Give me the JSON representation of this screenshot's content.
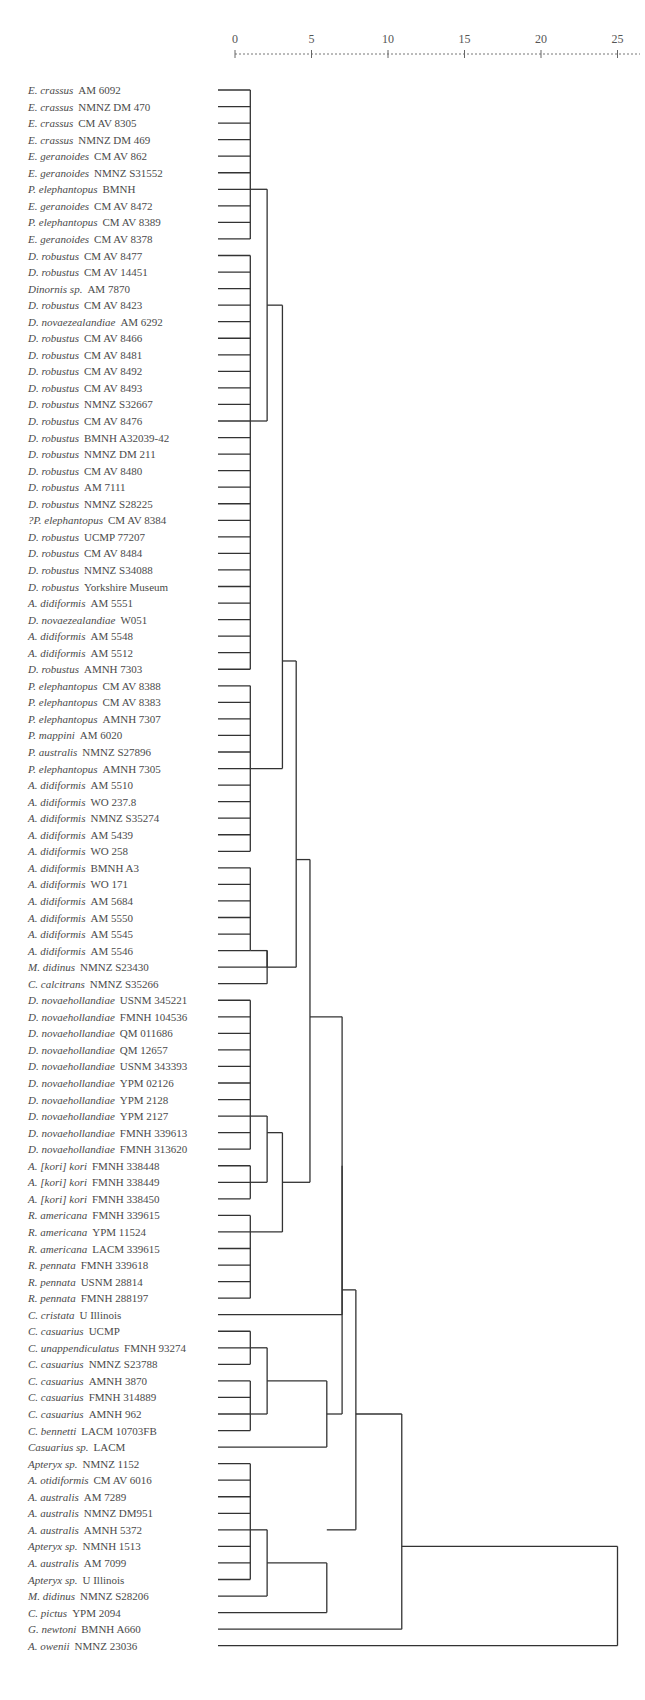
{
  "chart_data": {
    "type": "dendrogram",
    "title": "",
    "xlabel": "",
    "axis": {
      "ticks": [
        0,
        5,
        10,
        15,
        20,
        25
      ],
      "tick_labels": [
        "0",
        "5",
        "10",
        "15",
        "20",
        "25"
      ],
      "range": [
        0,
        25
      ],
      "style": "dashed ruler at top"
    },
    "leaves": [
      {
        "species": "E. crassus",
        "specimen": "AM 6092"
      },
      {
        "species": "E. crassus",
        "specimen": "NMNZ DM 470"
      },
      {
        "species": "E. crassus",
        "specimen": "CM AV 8305"
      },
      {
        "species": "E. crassus",
        "specimen": "NMNZ DM 469"
      },
      {
        "species": "E. geranoides",
        "specimen": "CM AV 862"
      },
      {
        "species": "E. geranoides",
        "specimen": "NMNZ S31552"
      },
      {
        "species": "P. elephantopus",
        "specimen": "BMNH"
      },
      {
        "species": "E. geranoides",
        "specimen": "CM AV 8472"
      },
      {
        "species": "P. elephantopus",
        "specimen": "CM AV 8389"
      },
      {
        "species": "E. geranoides",
        "specimen": "CM AV 8378"
      },
      {
        "species": "D. robustus",
        "specimen": "CM AV 8477"
      },
      {
        "species": "D. robustus",
        "specimen": "CM AV 14451"
      },
      {
        "species": "Dinornis sp.",
        "specimen": "AM 7870"
      },
      {
        "species": "D. robustus",
        "specimen": "CM AV 8423"
      },
      {
        "species": "D. novaezealandiae",
        "specimen": "AM 6292"
      },
      {
        "species": "D. robustus",
        "specimen": "CM AV 8466"
      },
      {
        "species": "D. robustus",
        "specimen": "CM AV 8481"
      },
      {
        "species": "D. robustus",
        "specimen": "CM AV 8492"
      },
      {
        "species": "D. robustus",
        "specimen": "CM AV 8493"
      },
      {
        "species": "D. robustus",
        "specimen": "NMNZ S32667"
      },
      {
        "species": "D. robustus",
        "specimen": "CM AV 8476"
      },
      {
        "species": "D. robustus",
        "specimen": "BMNH A32039-42"
      },
      {
        "species": "D. robustus",
        "specimen": "NMNZ DM 211"
      },
      {
        "species": "D. robustus",
        "specimen": "CM AV 8480"
      },
      {
        "species": "D. robustus",
        "specimen": "AM 7111"
      },
      {
        "species": "D. robustus",
        "specimen": "NMNZ S28225"
      },
      {
        "species": "?P. elephantopus",
        "specimen": "CM AV 8384"
      },
      {
        "species": "D. robustus",
        "specimen": "UCMP 77207"
      },
      {
        "species": "D. robustus",
        "specimen": "CM AV 8484"
      },
      {
        "species": "D. robustus",
        "specimen": "NMNZ S34088"
      },
      {
        "species": "D. robustus",
        "specimen": "Yorkshire Museum"
      },
      {
        "species": "A. didiformis",
        "specimen": "AM 5551"
      },
      {
        "species": "D. novaezealandiae",
        "specimen": "W051"
      },
      {
        "species": "A. didiformis",
        "specimen": "AM 5548"
      },
      {
        "species": "A. didiformis",
        "specimen": "AM 5512"
      },
      {
        "species": "D. robustus",
        "specimen": "AMNH 7303"
      },
      {
        "species": "P. elephantopus",
        "specimen": "CM AV 8388"
      },
      {
        "species": "P. elephantopus",
        "specimen": "CM AV 8383"
      },
      {
        "species": "P. elephantopus",
        "specimen": "AMNH 7307"
      },
      {
        "species": "P. mappini",
        "specimen": "AM 6020"
      },
      {
        "species": "P. australis",
        "specimen": "NMNZ S27896"
      },
      {
        "species": "P. elephantopus",
        "specimen": "AMNH 7305"
      },
      {
        "species": "A. didiformis",
        "specimen": "AM 5510"
      },
      {
        "species": "A. didiformis",
        "specimen": "WO 237.8"
      },
      {
        "species": "A. didiformis",
        "specimen": "NMNZ S35274"
      },
      {
        "species": "A. didiformis",
        "specimen": "AM 5439"
      },
      {
        "species": "A. didiformis",
        "specimen": "WO 258"
      },
      {
        "species": "A. didiformis",
        "specimen": "BMNH A3"
      },
      {
        "species": "A. didiformis",
        "specimen": "WO 171"
      },
      {
        "species": "A. didiformis",
        "specimen": "AM 5684"
      },
      {
        "species": "A. didiformis",
        "specimen": "AM 5550"
      },
      {
        "species": "A. didiformis",
        "specimen": "AM 5545"
      },
      {
        "species": "A. didiformis",
        "specimen": "AM 5546"
      },
      {
        "species": "M. didinus",
        "specimen": "NMNZ S23430"
      },
      {
        "species": "C. calcitrans",
        "specimen": "NMNZ S35266"
      },
      {
        "species": "D. novaehollandiae",
        "specimen": "USNM 345221"
      },
      {
        "species": "D. novaehollandiae",
        "specimen": "FMNH 104536"
      },
      {
        "species": "D. novaehollandiae",
        "specimen": "QM 011686"
      },
      {
        "species": "D. novaehollandiae",
        "specimen": "QM 12657"
      },
      {
        "species": "D. novaehollandiae",
        "specimen": "USNM 343393"
      },
      {
        "species": "D. novaehollandiae",
        "specimen": "YPM 02126"
      },
      {
        "species": "D. novaehollandiae",
        "specimen": "YPM 2128"
      },
      {
        "species": "D. novaehollandiae",
        "specimen": "YPM 2127"
      },
      {
        "species": "D. novaehollandiae",
        "specimen": "FMNH 339613"
      },
      {
        "species": "D. novaehollandiae",
        "specimen": "FMNH 313620"
      },
      {
        "species": "A. [kori] kori",
        "specimen": "FMNH 338448"
      },
      {
        "species": "A. [kori] kori",
        "specimen": "FMNH 338449"
      },
      {
        "species": "A. [kori] kori",
        "specimen": "FMNH 338450"
      },
      {
        "species": "R. americana",
        "specimen": "FMNH 339615"
      },
      {
        "species": "R. americana",
        "specimen": "YPM 11524"
      },
      {
        "species": "R. americana",
        "specimen": "LACM 339615"
      },
      {
        "species": "R. pennata",
        "specimen": "FMNH 339618"
      },
      {
        "species": "R. pennata",
        "specimen": "USNM 28814"
      },
      {
        "species": "R. pennata",
        "specimen": "FMNH 288197"
      },
      {
        "species": "C. cristata",
        "specimen": "U Illinois"
      },
      {
        "species": "C. casuarius",
        "specimen": "UCMP"
      },
      {
        "species": "C. unappendiculatus",
        "specimen": "FMNH 93274"
      },
      {
        "species": "C. casuarius",
        "specimen": "NMNZ S23788"
      },
      {
        "species": "C. casuarius",
        "specimen": "AMNH 3870"
      },
      {
        "species": "C. casuarius",
        "specimen": "FMNH 314889"
      },
      {
        "species": "C. casuarius",
        "specimen": "AMNH 962"
      },
      {
        "species": "C. bennetti",
        "specimen": "LACM 10703FB"
      },
      {
        "species": "Casuarius sp.",
        "specimen": "LACM"
      },
      {
        "species": "Apteryx sp.",
        "specimen": "NMNZ 1152"
      },
      {
        "species": "A. otidiformis",
        "specimen": "CM AV 6016"
      },
      {
        "species": "A. australis",
        "specimen": "AM 7289"
      },
      {
        "species": "A. australis",
        "specimen": "NMNZ DM951"
      },
      {
        "species": "A. australis",
        "specimen": "AMNH 5372"
      },
      {
        "species": "Apteryx sp.",
        "specimen": "NMNH 1513"
      },
      {
        "species": "A. australis",
        "specimen": "AM 7099"
      },
      {
        "species": "Apteryx sp.",
        "specimen": "U Illinois"
      },
      {
        "species": "M. didinus",
        "specimen": "NMNZ S28206"
      },
      {
        "species": "C. pictus",
        "specimen": "YPM 2094"
      },
      {
        "species": "G. newtoni",
        "specimen": "BMNH A660"
      },
      {
        "species": "A. owenii",
        "specimen": "NMNZ 23036"
      }
    ],
    "clusters": [
      {
        "id": "c1",
        "leaves": [
          0,
          9
        ],
        "height": 1.0
      },
      {
        "id": "c2",
        "leaves": [
          10,
          35
        ],
        "height": 1.0
      },
      {
        "id": "c3",
        "leaves": [
          36,
          46
        ],
        "height": 1.0
      },
      {
        "id": "c4",
        "leaves": [
          47,
          52
        ],
        "height": 1.0
      },
      {
        "id": "c5",
        "leaves": [
          55,
          64
        ],
        "height": 1.0
      },
      {
        "id": "c6",
        "leaves": [
          65,
          67
        ],
        "height": 1.0
      },
      {
        "id": "c7",
        "leaves": [
          68,
          73
        ],
        "height": 1.0
      },
      {
        "id": "c8",
        "leaves": [
          75,
          77
        ],
        "height": 1.0
      },
      {
        "id": "c9",
        "leaves": [
          78,
          81
        ],
        "height": 1.0
      },
      {
        "id": "c10",
        "leaves": [
          83,
          90
        ],
        "height": 1.0
      },
      {
        "id": "j_c1_c2",
        "children": [
          "c1",
          "c2"
        ],
        "height": 2.1
      },
      {
        "id": "j_c4_mdid",
        "children": [
          "c4",
          "leaf53"
        ],
        "height": 2.1
      },
      {
        "id": "j_c4_calc",
        "children": [
          "j_c4_mdid",
          "leaf54"
        ],
        "height": 2.1
      },
      {
        "id": "j_moa_c3",
        "children": [
          "j_c1_c2",
          "c3"
        ],
        "height": 3.1
      },
      {
        "id": "j_moa_all",
        "children": [
          "j_moa_c3",
          "j_c4_calc"
        ],
        "height": 4.0
      },
      {
        "id": "j_emu",
        "children": [
          "c5",
          "c6"
        ],
        "height": 2.1
      },
      {
        "id": "j_rhea",
        "children": [
          "j_emu",
          "c7"
        ],
        "height": 3.1
      },
      {
        "id": "j_ratite",
        "children": [
          "j_moa_all",
          "j_rhea"
        ],
        "height": 4.9
      },
      {
        "id": "j_cristata",
        "children": [
          "j_ratite",
          "leaf74"
        ],
        "height": 7.0
      },
      {
        "id": "j_cas1",
        "children": [
          "c8",
          "c9"
        ],
        "height": 2.1
      },
      {
        "id": "j_cas2",
        "children": [
          "j_cas1",
          "leaf82"
        ],
        "height": 6.0
      },
      {
        "id": "j_big",
        "children": [
          "j_cristata",
          "j_cas2"
        ],
        "height": 7.0
      },
      {
        "id": "j_kiwi",
        "children": [
          "c10",
          "leaf91"
        ],
        "height": 2.1
      },
      {
        "id": "j_kiwi2",
        "children": [
          "j_kiwi",
          "leaf92"
        ],
        "height": 6.0
      },
      {
        "id": "j_all1",
        "children": [
          "j_big",
          "j_kiwi2"
        ],
        "height": 7.9
      },
      {
        "id": "j_all2",
        "children": [
          "j_all1",
          "leaf93"
        ],
        "height": 10.9
      },
      {
        "id": "j_root",
        "children": [
          "j_all2",
          "leaf94"
        ],
        "height": 25.0
      }
    ],
    "line_color": "#333333",
    "label_color": "#4a4a4a"
  }
}
